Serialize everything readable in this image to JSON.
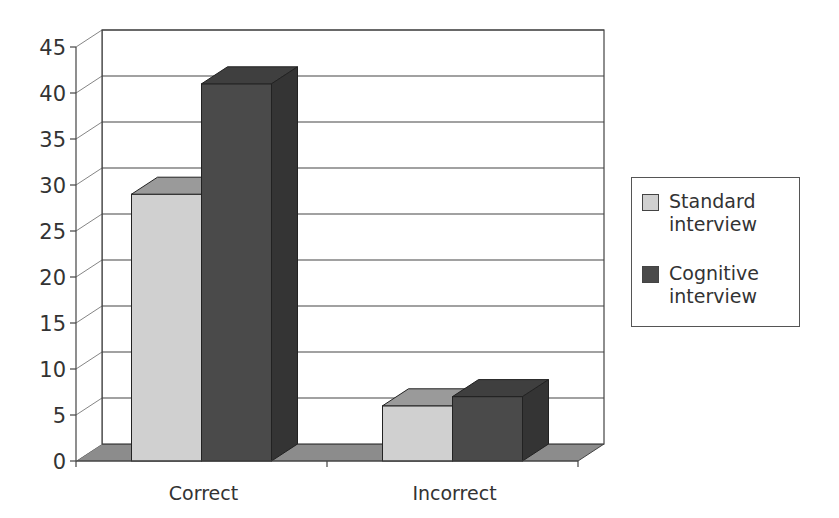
{
  "chart_data": {
    "type": "bar",
    "style": "3d-clustered-column",
    "title": "",
    "xlabel": "",
    "ylabel": "",
    "categories": [
      "Correct",
      "Incorrect"
    ],
    "series": [
      {
        "name": "Standard interview",
        "values": [
          29,
          6
        ],
        "color": "#d0d0d0"
      },
      {
        "name": "Cognitive interview",
        "values": [
          41,
          7
        ],
        "color": "#4a4a4a"
      }
    ],
    "ylim": [
      0,
      45
    ],
    "yticks": [
      0,
      5,
      10,
      15,
      20,
      25,
      30,
      35,
      40,
      45
    ],
    "grid": true,
    "legend_position": "right"
  },
  "legend": {
    "items": [
      {
        "label": "Standard interview",
        "color": "#d0d0d0"
      },
      {
        "label": "Cognitive interview",
        "color": "#4a4a4a"
      }
    ]
  },
  "axis": {
    "ticks": [
      "0",
      "5",
      "10",
      "15",
      "20",
      "25",
      "30",
      "35",
      "40",
      "45"
    ],
    "categories": [
      "Correct",
      "Incorrect"
    ]
  }
}
